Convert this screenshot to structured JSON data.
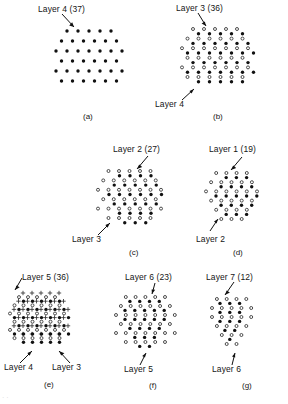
{
  "figure": {
    "type": "scientific-diagram",
    "symbols": {
      "filled": "filled-dot",
      "open": "open-circle",
      "plus": "plus-mark"
    }
  },
  "panels": [
    {
      "id": "a",
      "caption": "(a)",
      "labels": [
        {
          "text": "Layer 4 (37)",
          "symbol": "filled"
        }
      ],
      "layers": [
        {
          "name": "Layer 4",
          "count": 37,
          "symbol": "filled"
        }
      ]
    },
    {
      "id": "b",
      "caption": "(b)",
      "labels": [
        {
          "text": "Layer 3 (36)",
          "symbol": "filled"
        },
        {
          "text": "Layer 4",
          "symbol": "open"
        }
      ],
      "layers": [
        {
          "name": "Layer 3",
          "count": 36,
          "symbol": "filled"
        },
        {
          "name": "Layer 4",
          "count": 37,
          "symbol": "open"
        }
      ]
    },
    {
      "id": "c",
      "caption": "(c)",
      "labels": [
        {
          "text": "Layer 2 (27)",
          "symbol": "filled"
        },
        {
          "text": "Layer 3",
          "symbol": "open"
        }
      ],
      "layers": [
        {
          "name": "Layer 2",
          "count": 27,
          "symbol": "filled"
        },
        {
          "name": "Layer 3",
          "count": 36,
          "symbol": "open"
        }
      ]
    },
    {
      "id": "d",
      "caption": "(d)",
      "labels": [
        {
          "text": "Layer 1 (19)",
          "symbol": "filled"
        },
        {
          "text": "Layer 2",
          "symbol": "open"
        }
      ],
      "layers": [
        {
          "name": "Layer 1",
          "count": 19,
          "symbol": "filled"
        },
        {
          "name": "Layer 2",
          "count": 27,
          "symbol": "open"
        }
      ]
    },
    {
      "id": "e",
      "caption": "(e)",
      "labels": [
        {
          "text": "Layer 5 (36)",
          "symbol": "filled"
        },
        {
          "text": "Layer 4",
          "symbol": "open"
        },
        {
          "text": "Layer 3",
          "symbol": "plus"
        }
      ],
      "layers": [
        {
          "name": "Layer 5",
          "count": 36,
          "symbol": "filled"
        },
        {
          "name": "Layer 4",
          "count": 37,
          "symbol": "open"
        },
        {
          "name": "Layer 3",
          "count": 36,
          "symbol": "plus"
        }
      ]
    },
    {
      "id": "f",
      "caption": "(f)",
      "labels": [
        {
          "text": "Layer 6 (23)",
          "symbol": "filled"
        },
        {
          "text": "Layer 5",
          "symbol": "open"
        }
      ],
      "layers": [
        {
          "name": "Layer 6",
          "count": 23,
          "symbol": "filled"
        },
        {
          "name": "Layer 5",
          "count": 36,
          "symbol": "open"
        }
      ]
    },
    {
      "id": "g",
      "caption": "(g)",
      "labels": [
        {
          "text": "Layer 7 (12)",
          "symbol": "filled"
        },
        {
          "text": "Layer 6",
          "symbol": "open"
        }
      ],
      "layers": [
        {
          "name": "Layer 7",
          "count": 12,
          "symbol": "filled"
        },
        {
          "name": "Layer 6",
          "count": 23,
          "symbol": "open"
        }
      ]
    }
  ],
  "text": {
    "layer4_37": "Layer 4 (37)",
    "layer4": "Layer 4",
    "layer3_36": "Layer 3 (36)",
    "layer3": "Layer 3",
    "layer2_27": "Layer 2 (27)",
    "layer2": "Layer 2",
    "layer1_19": "Layer 1 (19)",
    "layer5_36": "Layer 5 (36)",
    "layer5": "Layer 5",
    "layer6_23": "Layer 6 (23)",
    "layer6": "Layer 6",
    "layer7_12": "Layer 7 (12)",
    "cap_a": "(a)",
    "cap_b": "(b)",
    "cap_c": "(c)",
    "cap_d": "(d)",
    "cap_e": "(e)",
    "cap_f": "(f)",
    "cap_g": "(g)"
  },
  "chart_data": {
    "type": "scatter",
    "title": "",
    "xlabel": "",
    "ylabel": "",
    "note": "Triangular/hexagonal lattice point sets per panel; counts given in labels",
    "series": [
      {
        "name": "Layer 1",
        "count": 19,
        "symbol": "filled-dot"
      },
      {
        "name": "Layer 2",
        "count": 27,
        "symbol": "filled-dot"
      },
      {
        "name": "Layer 3",
        "count": 36,
        "symbol": "filled-dot"
      },
      {
        "name": "Layer 4",
        "count": 37,
        "symbol": "filled-dot"
      },
      {
        "name": "Layer 5",
        "count": 36,
        "symbol": "filled-dot"
      },
      {
        "name": "Layer 6",
        "count": 23,
        "symbol": "filled-dot"
      },
      {
        "name": "Layer 7",
        "count": 12,
        "symbol": "filled-dot"
      }
    ]
  }
}
